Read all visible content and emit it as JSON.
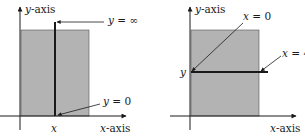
{
  "left_panel": {
    "y_axis_label": {
      "var": "y",
      "text": "-axis"
    },
    "x_axis_label": {
      "var": "x",
      "text": "-axis"
    },
    "x_tick_label": "x",
    "top_annotation": {
      "var": "y",
      "text": " = ∞"
    },
    "bottom_annotation": {
      "var": "y",
      "text": " = 0"
    }
  },
  "right_panel": {
    "y_axis_label": {
      "var": "y",
      "text": "-axis"
    },
    "x_axis_label": {
      "var": "x",
      "text": "-axis"
    },
    "y_tick_label": "y",
    "left_annotation": {
      "var": "x",
      "text": " = 0"
    },
    "right_annotation": {
      "var": "x",
      "text": " = 4"
    }
  },
  "colors": {
    "region_fill": "#b3b3b3",
    "line": "#1a1a1a"
  }
}
